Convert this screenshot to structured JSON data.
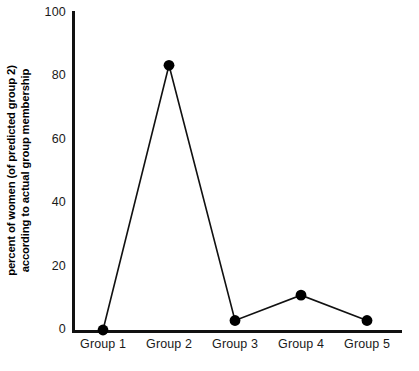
{
  "chart_data": {
    "type": "line",
    "title": "",
    "xlabel": "",
    "ylabel": "percent of women (of predicted group 2) according to actual group membership",
    "ylabel_lines": [
      "percent of women (of predicted group 2)",
      "according to actual group membership"
    ],
    "categories": [
      "Group 1",
      "Group 2",
      "Group 3",
      "Group 4",
      "Group 5"
    ],
    "values": [
      0,
      83.5,
      3,
      11,
      3
    ],
    "ylim": [
      0,
      100
    ],
    "yticks": [
      0,
      20,
      40,
      60,
      80,
      100
    ],
    "ytick_labels": [
      "0",
      "20",
      "40",
      "60",
      "80",
      "100"
    ],
    "grid": false,
    "legend": false,
    "marker": "filled-circle",
    "line_color": "#111111",
    "marker_color": "#000000",
    "axis_color": "#111111",
    "background": "#ffffff"
  },
  "figure": {
    "width": 419,
    "height": 371,
    "plot_left": 72,
    "plot_right": 402,
    "plot_top": 13,
    "plot_bottom": 330
  }
}
